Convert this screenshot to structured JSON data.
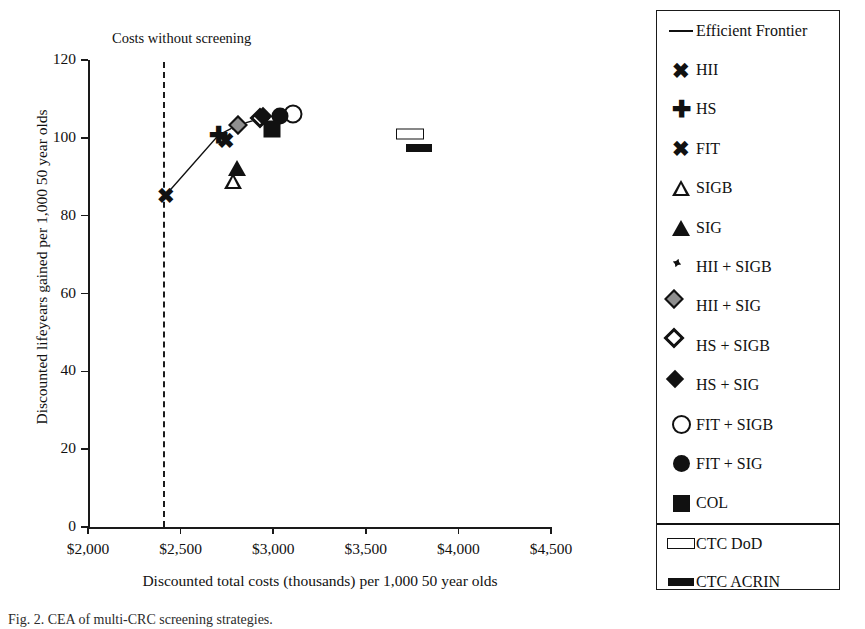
{
  "chart_data": {
    "type": "scatter",
    "title": "",
    "xlabel": "Discounted total costs (thousands) per 1,000 50 year olds",
    "ylabel": "Discounted lifeyears gained per 1,000 50 year olds",
    "xlim": [
      2000,
      4500
    ],
    "ylim": [
      0,
      120
    ],
    "xticks": [
      "$2,000",
      "$2,500",
      "$3,000",
      "$3,500",
      "$4,000",
      "$4,500"
    ],
    "xtick_values": [
      2000,
      2500,
      3000,
      3500,
      4000,
      4500
    ],
    "yticks": [
      "0",
      "20",
      "40",
      "60",
      "80",
      "100",
      "120"
    ],
    "ytick_values": [
      0,
      20,
      40,
      60,
      80,
      100,
      120
    ],
    "grid": false,
    "legend_position": "right",
    "annotations": [
      {
        "text": "Costs without screening",
        "x": 2405,
        "type": "vertical-dashed-line"
      }
    ],
    "vertical_reference_line": {
      "label": "Costs without screening",
      "x": 2405
    },
    "efficient_frontier": {
      "label": "Efficient Frontier",
      "points": [
        {
          "name": "HII",
          "x": 2420,
          "y": 85.3
        },
        {
          "name": "HS",
          "x": 2705,
          "y": 100.7
        },
        {
          "name": "HII + SIG",
          "x": 2805,
          "y": 103.2
        },
        {
          "name": "HS + SIG",
          "x": 2955,
          "y": 105.3
        },
        {
          "name": "FIT + SIG",
          "x": 3035,
          "y": 105.6
        },
        {
          "name": "FIT + SIGB",
          "x": 3105,
          "y": 106.2
        }
      ]
    },
    "points": [
      {
        "name": "HII",
        "marker": "x-bold",
        "x": 2420,
        "y": 85.3
      },
      {
        "name": "HS",
        "marker": "plus",
        "x": 2705,
        "y": 100.7
      },
      {
        "name": "FIT",
        "marker": "x",
        "x": 2745,
        "y": 99.5
      },
      {
        "name": "SIGB",
        "marker": "triangle-open",
        "x": 2785,
        "y": 88.9
      },
      {
        "name": "SIG",
        "marker": "triangle-filled",
        "x": 2805,
        "y": 92.2
      },
      {
        "name": "HII + SIGB",
        "marker": "diamond-splat",
        "x": 2790,
        "y": 103.0
      },
      {
        "name": "HII + SIG",
        "marker": "diamond-gray",
        "x": 2810,
        "y": 103.2
      },
      {
        "name": "HS + SIGB",
        "marker": "diamond-open",
        "x": 2930,
        "y": 105.0
      },
      {
        "name": "HS + SIG",
        "marker": "diamond-filled",
        "x": 2945,
        "y": 105.6
      },
      {
        "name": "FIT + SIGB",
        "marker": "circle-open",
        "x": 3105,
        "y": 106.2
      },
      {
        "name": "FIT + SIG",
        "marker": "circle-filled",
        "x": 3035,
        "y": 105.6
      },
      {
        "name": "COL",
        "marker": "square-filled",
        "x": 2995,
        "y": 102.3
      },
      {
        "name": "CTC DoD",
        "marker": "bar-open",
        "x": 3740,
        "y": 101.0
      },
      {
        "name": "CTC ACRIN",
        "marker": "bar-filled",
        "x": 3785,
        "y": 97.4
      }
    ],
    "legend": [
      {
        "label": "Efficient Frontier",
        "marker": "line",
        "divider_above": false
      },
      {
        "label": "HII",
        "marker": "x-bold",
        "divider_above": false
      },
      {
        "label": "HS",
        "marker": "plus",
        "divider_above": false
      },
      {
        "label": "FIT",
        "marker": "x",
        "divider_above": false
      },
      {
        "label": "SIGB",
        "marker": "triangle-open",
        "divider_above": false
      },
      {
        "label": "SIG",
        "marker": "triangle-filled",
        "divider_above": false
      },
      {
        "label": "HII + SIGB",
        "marker": "diamond-splat",
        "divider_above": false
      },
      {
        "label": "HII + SIG",
        "marker": "diamond-gray",
        "divider_above": false
      },
      {
        "label": "HS + SIGB",
        "marker": "diamond-open",
        "divider_above": false
      },
      {
        "label": "HS + SIG",
        "marker": "diamond-filled",
        "divider_above": false
      },
      {
        "label": "FIT + SIGB",
        "marker": "circle-open",
        "divider_above": false
      },
      {
        "label": "FIT + SIG",
        "marker": "circle-filled",
        "divider_above": false
      },
      {
        "label": "COL",
        "marker": "square-filled",
        "divider_above": false
      },
      {
        "label": "CTC DoD",
        "marker": "bar-open",
        "divider_above": true
      },
      {
        "label": "CTC ACRIN",
        "marker": "bar-filled",
        "divider_above": false
      }
    ]
  },
  "caption": "Fig. 2.  CEA of multi-CRC screening strategies."
}
